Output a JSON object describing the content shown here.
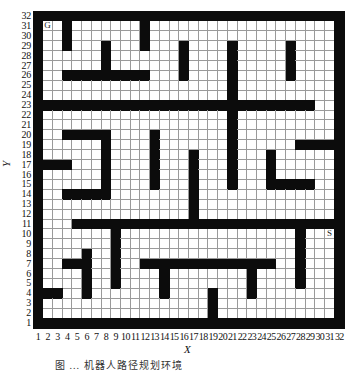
{
  "figure": {
    "type": "grid-map",
    "grid_size": {
      "cols": 32,
      "rows": 32
    },
    "x_axis": {
      "title": "X",
      "ticks": [
        "1",
        "2",
        "3",
        "4",
        "5",
        "6",
        "7",
        "8",
        "9",
        "10",
        "11",
        "12",
        "13",
        "14",
        "15",
        "16",
        "17",
        "18",
        "19",
        "20",
        "21",
        "22",
        "23",
        "24",
        "25",
        "26",
        "27",
        "28",
        "29",
        "30",
        "31",
        "32"
      ]
    },
    "y_axis": {
      "title": "Y",
      "ticks": [
        "1",
        "2",
        "3",
        "4",
        "5",
        "6",
        "7",
        "8",
        "9",
        "10",
        "11",
        "12",
        "13",
        "14",
        "15",
        "16",
        "17",
        "18",
        "19",
        "20",
        "21",
        "22",
        "23",
        "24",
        "25",
        "26",
        "27",
        "28",
        "29",
        "30",
        "31",
        "32"
      ]
    },
    "markers": [
      {
        "label": "G",
        "name": "goal",
        "col": 2,
        "row": 31
      },
      {
        "label": "S",
        "name": "start",
        "col": 31,
        "row": 10
      }
    ],
    "colors": {
      "wall": "#0c0c0c",
      "free": "#ffffff",
      "gridline": "#9a9a9a"
    },
    "walls": [
      {
        "axis": "col",
        "at": 1,
        "from": 1,
        "to": 32
      },
      {
        "axis": "col",
        "at": 32,
        "from": 1,
        "to": 32
      },
      {
        "axis": "row",
        "at": 1,
        "from": 1,
        "to": 32
      },
      {
        "axis": "row",
        "at": 32,
        "from": 1,
        "to": 32
      },
      {
        "axis": "col",
        "at": 4,
        "from": 29,
        "to": 31
      },
      {
        "axis": "col",
        "at": 12,
        "from": 29,
        "to": 31
      },
      {
        "axis": "col",
        "at": 8,
        "from": 26,
        "to": 29
      },
      {
        "axis": "row",
        "at": 26,
        "from": 4,
        "to": 12
      },
      {
        "axis": "col",
        "at": 16,
        "from": 26,
        "to": 29
      },
      {
        "axis": "col",
        "at": 27,
        "from": 26,
        "to": 29
      },
      {
        "axis": "col",
        "at": 21,
        "from": 15,
        "to": 29
      },
      {
        "axis": "row",
        "at": 23,
        "from": 1,
        "to": 29
      },
      {
        "axis": "row",
        "at": 20,
        "from": 4,
        "to": 8
      },
      {
        "axis": "col",
        "at": 8,
        "from": 14,
        "to": 20
      },
      {
        "axis": "row",
        "at": 14,
        "from": 4,
        "to": 8
      },
      {
        "axis": "row",
        "at": 17,
        "from": 1,
        "to": 4
      },
      {
        "axis": "col",
        "at": 13,
        "from": 15,
        "to": 20
      },
      {
        "axis": "col",
        "at": 17,
        "from": 11,
        "to": 18
      },
      {
        "axis": "row",
        "at": 19,
        "from": 28,
        "to": 31
      },
      {
        "axis": "col",
        "at": 25,
        "from": 15,
        "to": 18
      },
      {
        "axis": "row",
        "at": 15,
        "from": 25,
        "to": 29
      },
      {
        "axis": "row",
        "at": 11,
        "from": 5,
        "to": 31
      },
      {
        "axis": "col",
        "at": 9,
        "from": 5,
        "to": 11
      },
      {
        "axis": "col",
        "at": 6,
        "from": 4,
        "to": 8
      },
      {
        "axis": "row",
        "at": 7,
        "from": 4,
        "to": 6
      },
      {
        "axis": "row",
        "at": 4,
        "from": 1,
        "to": 3
      },
      {
        "axis": "row",
        "at": 7,
        "from": 12,
        "to": 25
      },
      {
        "axis": "col",
        "at": 14,
        "from": 4,
        "to": 7
      },
      {
        "axis": "col",
        "at": 23,
        "from": 4,
        "to": 7
      },
      {
        "axis": "col",
        "at": 19,
        "from": 2,
        "to": 4
      },
      {
        "axis": "col",
        "at": 28,
        "from": 5,
        "to": 11
      }
    ],
    "caption": "图 ... 机器人路径规划环境"
  }
}
